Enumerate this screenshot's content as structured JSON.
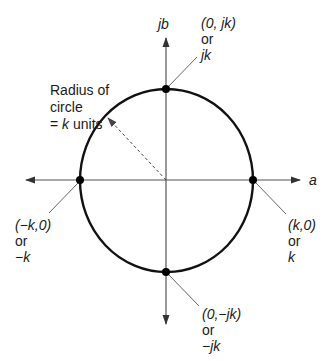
{
  "diagram": {
    "title": "",
    "axes": {
      "horizontal_label": "a",
      "vertical_label": "jb"
    },
    "circle": {
      "radius_label_line1": "Radius of",
      "radius_label_line2": "circle",
      "radius_label_line3_prefix": "= ",
      "radius_label_line3_var": "k",
      "radius_label_line3_suffix": " units"
    },
    "points": {
      "top": {
        "coord": "(0, jk)",
        "or": "or",
        "value": "jk"
      },
      "left": {
        "coord": "(−k,0)",
        "or": "or",
        "value": "−k"
      },
      "right": {
        "coord": "(k,0)",
        "or": "or",
        "value": "k"
      },
      "bottom": {
        "coord": "(0,−jk)",
        "or": "or",
        "value": "−jk"
      }
    },
    "colors": {
      "axis": "#333333",
      "circle": "#111111",
      "leader": "#555555",
      "text": "#1a1a1a"
    }
  }
}
